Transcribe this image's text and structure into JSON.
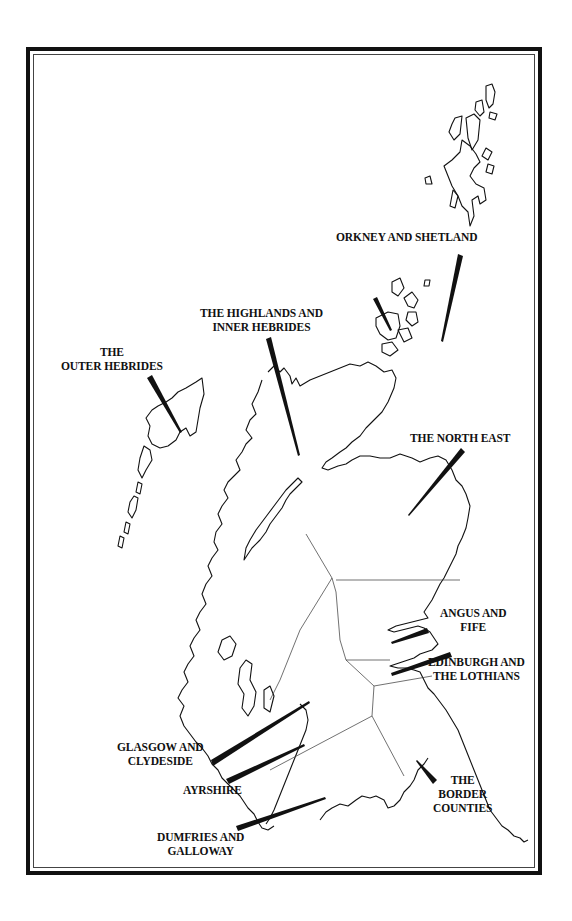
{
  "map": {
    "title": "Regions of Scotland",
    "regions": [
      {
        "id": "orkney-shetland",
        "lines": [
          "ORKNEY AND SHETLAND"
        ]
      },
      {
        "id": "highlands",
        "lines": [
          "THE HIGHLANDS AND",
          "INNER HEBRIDES"
        ]
      },
      {
        "id": "outer-hebrides",
        "lines": [
          "THE",
          "OUTER HEBRIDES"
        ]
      },
      {
        "id": "north-east",
        "lines": [
          "THE NORTH EAST"
        ]
      },
      {
        "id": "angus-fife",
        "lines": [
          "ANGUS AND",
          "FIFE"
        ]
      },
      {
        "id": "edinburgh-lothians",
        "lines": [
          "EDINBURGH AND",
          "THE LOTHIANS"
        ]
      },
      {
        "id": "glasgow-clydeside",
        "lines": [
          "GLASGOW AND",
          "CLYDESIDE"
        ]
      },
      {
        "id": "ayrshire",
        "lines": [
          "AYRSHIRE"
        ]
      },
      {
        "id": "border-counties",
        "lines": [
          "THE",
          "BORDER",
          "COUNTIES"
        ]
      },
      {
        "id": "dumfries-galloway",
        "lines": [
          "DUMFRIES AND",
          "GALLOWAY"
        ]
      }
    ],
    "colors": {
      "ink": "#111111",
      "background": "#ffffff"
    }
  }
}
